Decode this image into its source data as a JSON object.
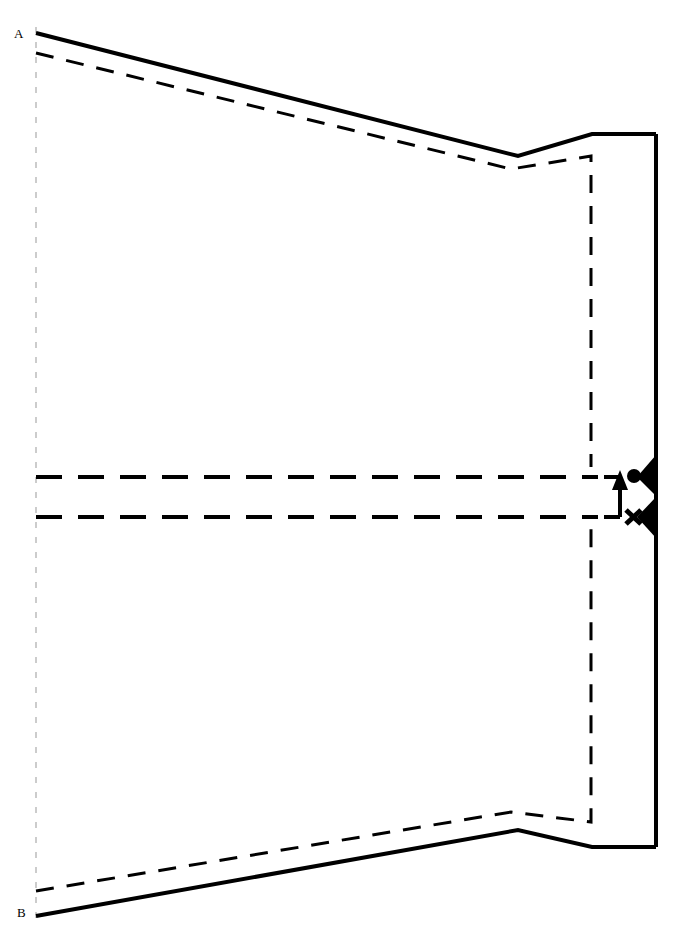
{
  "diagram": {
    "background_color": "#ffffff",
    "stroke_color": "#000000",
    "axis_color": "#cccccc",
    "canvas": {
      "width": 675,
      "height": 931
    },
    "labels": [
      {
        "id": "point-a",
        "text": "A",
        "x": 14,
        "y": 27
      },
      {
        "id": "point-b",
        "text": "B",
        "x": 17,
        "y": 906
      }
    ],
    "geometry": {
      "solid_upper": {
        "name": "upper-solid-contour",
        "stroke_width": 4,
        "points": "36,33 518,156 592,134 656,134"
      },
      "solid_lower": {
        "name": "lower-solid-contour",
        "stroke_width": 4,
        "points": "36,916 518,830 592,847 656,847"
      },
      "solid_right_edge": {
        "name": "exit-plane-edge",
        "stroke_width": 4,
        "points": "656,134 656,847"
      },
      "dashed_upper": {
        "name": "upper-dashed-contour",
        "stroke_width": 3,
        "dash": "18,13",
        "points": "36,53 511,169 591,156 591,467"
      },
      "dashed_lower": {
        "name": "lower-dashed-contour",
        "stroke_width": 3,
        "dash": "18,13",
        "points": "36,891 511,812 591,822 591,527"
      },
      "dashed_center_upper": {
        "name": "upper-centerline-dashed",
        "stroke_width": 4,
        "dash": "26,16",
        "points": "36,477 598,477"
      },
      "dashed_center_lower": {
        "name": "lower-centerline-dashed",
        "stroke_width": 4,
        "dash": "26,16",
        "points": "36,517 598,517"
      },
      "axis_vertical": {
        "name": "reference-axis",
        "stroke_width": 2,
        "dash": "6,9",
        "points": "36,27 36,922"
      }
    },
    "annotation": {
      "name": "throat-gap-measure",
      "bracket_top": {
        "points": "604,477 620,477"
      },
      "bracket_bottom": {
        "points": "604,517 620,517"
      },
      "arrow_shaft": {
        "points": "620,517 620,484"
      },
      "arrow_head": {
        "points": "620,470 628,490 612,490"
      },
      "marker_circle": {
        "cx": 634,
        "cy": 476,
        "r": 7
      },
      "marker_cross": {
        "cx": 633,
        "cy": 517,
        "size": 8,
        "stroke_width": 5
      },
      "wedge_upper": {
        "points": "656,455 656,496 637,477"
      },
      "wedge_lower": {
        "points": "656,497 656,538 637,517"
      }
    }
  }
}
